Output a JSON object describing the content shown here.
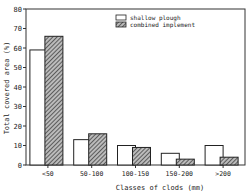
{
  "chart_data": {
    "type": "bar",
    "title": "",
    "xlabel": "Classes of clods (mm)",
    "ylabel": "Total covered area (%)",
    "ylim": [
      0,
      80
    ],
    "yticks": [
      0,
      10,
      20,
      30,
      40,
      50,
      60,
      70,
      80
    ],
    "categories": [
      "<50",
      "50-100",
      "100-150",
      "150-200",
      ">200"
    ],
    "series": [
      {
        "name": "shallow plough",
        "fill": "white",
        "values": [
          59,
          13,
          10,
          6,
          10
        ]
      },
      {
        "name": "combined implement",
        "fill": "hatched",
        "values": [
          66,
          16,
          9,
          3,
          4
        ]
      }
    ],
    "legend_position": "upper right",
    "grid": false
  },
  "colors": {
    "axis": "#333333",
    "bar_outline": "#222222",
    "hatch": "#444444",
    "background": "#ffffff"
  }
}
